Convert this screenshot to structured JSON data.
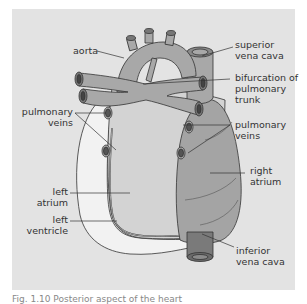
{
  "figure": {
    "colors": {
      "background": "#e3e3e3",
      "vessel": "#a8a8a8",
      "heart_body": "#d3d3d3",
      "right_atrium": "#a4a4a4",
      "left_ventricle": "#f2f2f2",
      "vena_cava_dark": "#7a7a7a",
      "outline": "#333333"
    },
    "labels": {
      "aorta": "aorta",
      "superior_vena_cava_1": "superior",
      "superior_vena_cava_2": "vena cava",
      "bifurcation_1": "bifurcation of",
      "bifurcation_2": "pulmonary",
      "bifurcation_3": "trunk",
      "pulmonary_veins_left_1": "pulmonary",
      "pulmonary_veins_left_2": "veins",
      "pulmonary_veins_right_1": "pulmonary",
      "pulmonary_veins_right_2": "veins",
      "right_atrium_1": "right",
      "right_atrium_2": "atrium",
      "left_atrium_1": "left",
      "left_atrium_2": "atrium",
      "left_ventricle_1": "left",
      "left_ventricle_2": "ventricle",
      "inferior_vena_cava_1": "inferior",
      "inferior_vena_cava_2": "vena cava"
    },
    "caption": "Fig. 1.10 Posterior aspect of the heart"
  }
}
